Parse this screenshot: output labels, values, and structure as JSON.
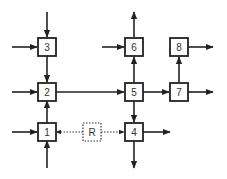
{
  "diagram": {
    "nodes": [
      {
        "id": "n1",
        "label": "1",
        "x": 38,
        "y": 123,
        "style": "solid"
      },
      {
        "id": "n2",
        "label": "2",
        "x": 38,
        "y": 83,
        "style": "solid"
      },
      {
        "id": "n3",
        "label": "3",
        "x": 38,
        "y": 38,
        "style": "solid"
      },
      {
        "id": "n4",
        "label": "4",
        "x": 125,
        "y": 123,
        "style": "solid"
      },
      {
        "id": "n5",
        "label": "5",
        "x": 125,
        "y": 83,
        "style": "solid"
      },
      {
        "id": "n6",
        "label": "6",
        "x": 125,
        "y": 38,
        "style": "solid"
      },
      {
        "id": "n7",
        "label": "7",
        "x": 170,
        "y": 83,
        "style": "solid"
      },
      {
        "id": "n8",
        "label": "8",
        "x": 170,
        "y": 38,
        "style": "solid"
      },
      {
        "id": "nR",
        "label": "R",
        "x": 83,
        "y": 123,
        "style": "dashed"
      }
    ],
    "edges": [
      {
        "from": "external-top",
        "to": "3"
      },
      {
        "from": "external-left",
        "to": "3"
      },
      {
        "from": "3",
        "to": "2"
      },
      {
        "from": "external-left",
        "to": "2"
      },
      {
        "from": "1",
        "to": "2"
      },
      {
        "from": "2",
        "to": "5"
      },
      {
        "from": "external-left",
        "to": "1"
      },
      {
        "from": "external-bottom",
        "to": "1"
      },
      {
        "from": "R",
        "to": "1",
        "style": "dotted"
      },
      {
        "from": "R",
        "to": "4",
        "style": "dotted"
      },
      {
        "from": "external-left",
        "to": "6"
      },
      {
        "from": "6",
        "to": "external-top"
      },
      {
        "from": "5",
        "to": "6"
      },
      {
        "from": "5",
        "to": "4"
      },
      {
        "from": "5",
        "to": "7"
      },
      {
        "from": "4",
        "to": "external-right"
      },
      {
        "from": "4",
        "to": "external-bottom"
      },
      {
        "from": "7",
        "to": "8"
      },
      {
        "from": "7",
        "to": "external-right"
      },
      {
        "from": "8",
        "to": "external-right"
      }
    ],
    "colors": {
      "line": "#222222",
      "box_border": "#222222",
      "dashed_border": "#333333",
      "background": "#ffffff"
    }
  }
}
